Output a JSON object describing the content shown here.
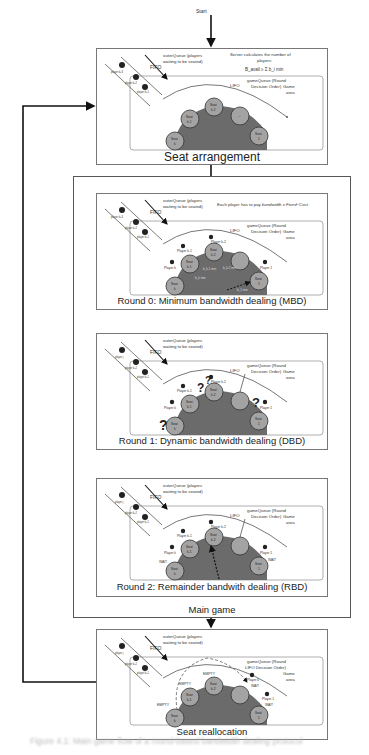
{
  "start_label": "Start",
  "seat_arrangement": {
    "title": "Seat arrangement",
    "outer_queue_label": "outerQueue (players waiting to be seated)",
    "server_note": "Server calculates the number of players:",
    "formula": "B_avail ≥ Σ(i=1..k) b_i min",
    "game_queue_label": "gameQueue (Round Decision Order)",
    "lifo_label": "LIFO",
    "fifo_label": "FIFO",
    "game_area_label": "Game area",
    "queue_players": [
      "player k+1",
      "player k+2",
      "player k+3"
    ],
    "seats": [
      "Seat k",
      "Seat k-1",
      "Seat k-2",
      "...",
      "Seat 1"
    ]
  },
  "main_game": {
    "label": "Main game",
    "rounds": [
      {
        "title": "Round 0: Minimum bandwidth dealing (MBD)",
        "outer_queue_label": "outerQueue (players waiting to be seated)",
        "note": "Each player has to pay bandwidth x Fixed-Cost",
        "game_queue_label": "gameQueue (Round Decision Order)",
        "lifo_label": "LIFO",
        "fifo_label": "FIFO",
        "game_area_label": "Game area",
        "queue_players": [
          "player k+3",
          "player k+2",
          "player k+1"
        ],
        "players": [
          "Player k",
          "Player k-1",
          "Player k-2",
          "Player 1"
        ],
        "seats": [
          "Seat k",
          "Seat k-1",
          "Seat k-2",
          "...",
          "Seat 1"
        ],
        "flow_labels": [
          "b_k min",
          "b_k-1 min",
          "b_k-2 min",
          "b_1 min"
        ]
      },
      {
        "title": "Round 1: Dynamic bandwidth dealing (DBD)",
        "outer_queue_label": "outerQueue (players waiting to be seated)",
        "game_queue_label": "gameQueue (Round Decision Order)",
        "lifo_label": "LIFO",
        "fifo_label": "FIFO",
        "game_area_label": "Game area",
        "queue_players": [
          "player j",
          "player k+2",
          "player k+1"
        ],
        "players": [
          "Player k",
          "Player k-1",
          "Player k-2",
          "Player 1"
        ],
        "seats": [
          "Seat k",
          "Seat k-1",
          "Seat k-2",
          "...",
          "Seat 1"
        ],
        "decision_marks": [
          "?",
          "?",
          "?",
          "?"
        ]
      },
      {
        "title": "Round 2: Remainder bandwith dealing (RBD)",
        "outer_queue_label": "outerQueue (players waiting to be seated)",
        "game_queue_label": "gameQueue (Round Decision Order)",
        "lifo_label": "LIFO",
        "fifo_label": "FIFO",
        "game_area_label": "Game area",
        "queue_players": [
          "player j",
          "player k+2",
          "player k+1"
        ],
        "players": [
          "Player k",
          "Player k-1",
          "Player k-2",
          "Player 1"
        ],
        "seats": [
          "Seat k",
          "Seat k-1",
          "Seat k-2",
          "...",
          "Seat 1"
        ],
        "status_labels": [
          "WAIT",
          "WAIT"
        ]
      }
    ]
  },
  "seat_reallocation": {
    "title": "Seat reallocation",
    "outer_queue_label": "outerQueue (players waiting to be seated)",
    "game_queue_label": "gameQueue (Round Decision Order)",
    "lifo_label": "LIFO",
    "fifo_label": "FIFO",
    "game_area_label": "Game area",
    "queue_players": [
      "player j",
      "player k+2",
      "player k+1"
    ],
    "players": [
      "Player k",
      "Player 1"
    ],
    "seats": [
      "Seat k",
      "Seat k-1",
      "Seat k-2",
      "...",
      "Seat 1"
    ],
    "empty_labels": [
      "EMPTY",
      "EMPTY",
      "EMPTY"
    ],
    "status_labels": [
      "WAIT",
      "WAIT"
    ]
  },
  "caption": "Figure 4.1: Main game flow of a round-based bandwidth dealing protocol",
  "colors": {
    "seat_fill": "#a3a3a3",
    "table_fill": "#6b6b6b",
    "line": "#222222",
    "box_border": "#777777"
  }
}
